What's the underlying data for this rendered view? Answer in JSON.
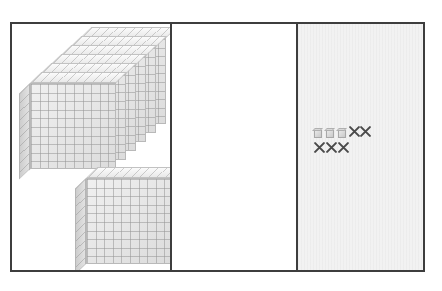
{
  "figure": {
    "panel_count": 3,
    "frame": {
      "border_color": "#3d3d3d",
      "background": "#ffffff"
    }
  },
  "panels": [
    {
      "id": "panel-left",
      "name": "hundreds-flats-panel",
      "background": "#ffffff",
      "contents": {
        "flat_stack": {
          "name": "stacked-hundred-flats",
          "count": 6,
          "block_value": 100,
          "total_value": 600,
          "grid": "10x10"
        },
        "single_flat": {
          "name": "single-hundred-flat",
          "count": 1,
          "block_value": 100,
          "total_value": 100,
          "grid": "10x10"
        },
        "panel_total_value": 700
      }
    },
    {
      "id": "panel-mid",
      "name": "empty-work-panel",
      "background": "#ffffff",
      "contents": {
        "items": []
      }
    },
    {
      "id": "panel-right",
      "name": "unit-cubes-and-crossouts-panel",
      "background": "#f2f2f2",
      "contents": {
        "rows": [
          {
            "name": "row-1",
            "unit_cubes": 3,
            "crossed_out": 2,
            "items": [
              "cube",
              "cube",
              "cube",
              "x",
              "x"
            ]
          },
          {
            "name": "row-2",
            "unit_cubes": 0,
            "crossed_out": 3,
            "items": [
              "x",
              "x",
              "x"
            ]
          }
        ],
        "remaining_cubes": 3,
        "crossed_out_total": 5,
        "block_value": 1
      }
    }
  ],
  "colors": {
    "frame_border": "#3d3d3d",
    "block_face": "#e3e3e3",
    "block_grid_line": "#969696",
    "block_top": "#f5f5f5",
    "block_side": "#cfcfcf",
    "x_mark": "#4a4a4a",
    "right_panel_bg": "#f2f2f2",
    "white_panel_bg": "#ffffff"
  }
}
